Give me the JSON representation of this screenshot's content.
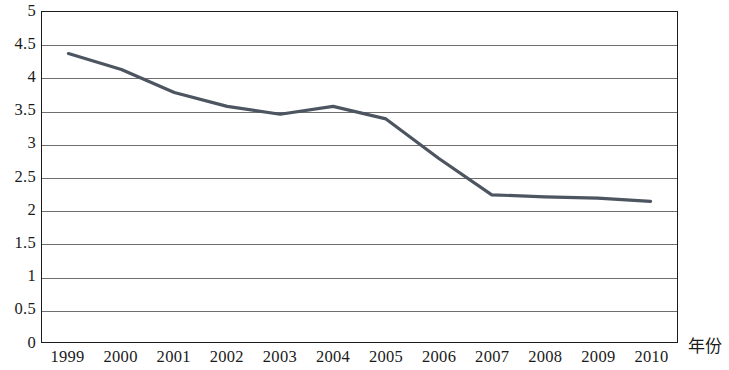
{
  "chart_data": {
    "type": "line",
    "title": "",
    "subtitle": "",
    "xlabel": "年份",
    "ylabel": "",
    "categories": [
      "1999",
      "2000",
      "2001",
      "2002",
      "2003",
      "2004",
      "2005",
      "2006",
      "2007",
      "2008",
      "2009",
      "2010"
    ],
    "values": [
      4.37,
      4.13,
      3.78,
      3.57,
      3.45,
      3.57,
      3.38,
      2.78,
      2.23,
      2.2,
      2.18,
      2.13
    ],
    "series": [
      {
        "name": "",
        "values": [
          4.37,
          4.13,
          3.78,
          3.57,
          3.45,
          3.57,
          3.38,
          2.78,
          2.23,
          2.2,
          2.18,
          2.13
        ]
      }
    ],
    "ylim": [
      0,
      5
    ],
    "y_ticks": [
      "0",
      "0.5",
      "1",
      "1.5",
      "2",
      "2.5",
      "3",
      "3.5",
      "4",
      "4.5",
      "5"
    ],
    "y_tick_values": [
      0,
      0.5,
      1,
      1.5,
      2,
      2.5,
      3,
      3.5,
      4,
      4.5,
      5
    ],
    "x_ticks": [
      "1999",
      "2000",
      "2001",
      "2002",
      "2003",
      "2004",
      "2005",
      "2006",
      "2007",
      "2008",
      "2009",
      "2010"
    ],
    "grid": "horizontal",
    "legend": "none",
    "legend_position": "none",
    "line_color": "#4d5560",
    "grid_color": "#6f6f6f",
    "frame_color": "#1c1c1c",
    "background_color": "#ffffff",
    "line_width": 3.2,
    "markers": "none",
    "annotations": []
  }
}
